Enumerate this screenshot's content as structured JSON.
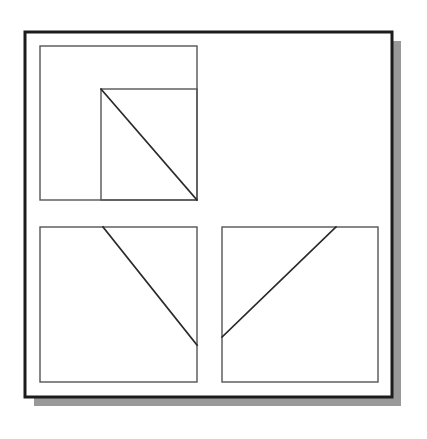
{
  "figure": {
    "name": "three-framed-squares-with-diagonals",
    "canvas": {
      "width": 427,
      "height": 439,
      "background": "#ffffff"
    },
    "colors": {
      "paper": "#ffffff",
      "outer_frame_stroke": "#1c1c1c",
      "panel_stroke": "#555555",
      "diagonal_stroke": "#2a2a2a",
      "shadow": "#999999"
    },
    "outer_frame": {
      "label": "outer-border",
      "x": 25,
      "y": 32,
      "width": 367,
      "height": 365,
      "stroke_width": 3
    },
    "shadow": {
      "label": "drop-shadow",
      "offset_x": 9,
      "offset_y": 9,
      "color": "#999999"
    },
    "panels": [
      {
        "id": "top-left-panel",
        "label": "Top left square",
        "x": 40,
        "y": 46,
        "width": 157,
        "height": 154,
        "stroke_width": 1.4,
        "inner_square": {
          "label": "inner-square",
          "x": 101,
          "y": 89,
          "width": 96,
          "height": 111
        },
        "diagonal": {
          "label": "diagonal-down-right",
          "x1": 101,
          "y1": 89,
          "x2": 197,
          "y2": 200,
          "direction": "top-left-to-bottom-right"
        }
      },
      {
        "id": "bottom-left-panel",
        "label": "Bottom left square",
        "x": 40,
        "y": 227,
        "width": 157,
        "height": 155,
        "stroke_width": 1.4,
        "inner_square": null,
        "diagonal": {
          "label": "diagonal-down-right",
          "x1": 103,
          "y1": 227,
          "x2": 197,
          "y2": 345,
          "direction": "top-to-right-edge"
        }
      },
      {
        "id": "bottom-right-panel",
        "label": "Bottom right square",
        "x": 222,
        "y": 227,
        "width": 156,
        "height": 155,
        "stroke_width": 1.4,
        "inner_square": null,
        "diagonal": {
          "label": "diagonal-up-right",
          "x1": 222,
          "y1": 337,
          "x2": 336,
          "y2": 227,
          "direction": "left-edge-to-top-edge"
        }
      }
    ]
  }
}
